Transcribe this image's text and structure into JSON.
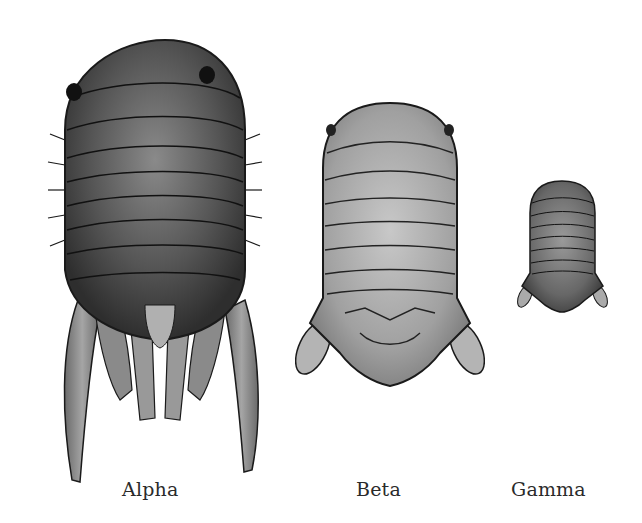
{
  "figure": {
    "specimens": [
      {
        "id": "alpha",
        "label": "Alpha",
        "relative_size": "large",
        "shading": "dark"
      },
      {
        "id": "beta",
        "label": "Beta",
        "relative_size": "medium",
        "shading": "light"
      },
      {
        "id": "gamma",
        "label": "Gamma",
        "relative_size": "small",
        "shading": "medium"
      }
    ]
  },
  "colors": {
    "background": "#ffffff",
    "alpha_body": "#4a4a4a",
    "beta_body": "#a8a8a8",
    "gamma_body": "#6e6e6e",
    "outline": "#1a1a1a"
  }
}
